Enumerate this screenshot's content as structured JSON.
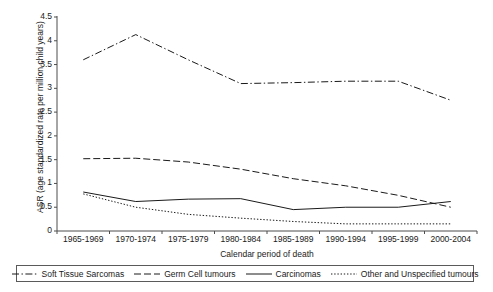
{
  "chart_data": {
    "type": "line",
    "title": "",
    "xlabel": "Calendar period of death",
    "ylabel": "ASR (age standardized rate per million child years)",
    "categories": [
      "1965-1969",
      "1970-1974",
      "1975-1979",
      "1980-1984",
      "1985-1989",
      "1990-1994",
      "1995-1999",
      "2000-2004"
    ],
    "ylim": [
      0,
      4.5
    ],
    "yticks": [
      "0",
      "0.5",
      "1",
      "1.5",
      "2",
      "2.5",
      "3",
      "3.5",
      "4",
      "4.5"
    ],
    "ytick_values": [
      0,
      0.5,
      1,
      1.5,
      2,
      2.5,
      3,
      3.5,
      4,
      4.5
    ],
    "grid": false,
    "legend_position": "bottom",
    "series": [
      {
        "name": "Soft Tissue Sarcomas",
        "style": "dash-dot",
        "color": "#1a1a1a",
        "values": [
          3.6,
          4.13,
          3.6,
          3.1,
          3.12,
          3.15,
          3.15,
          2.75
        ]
      },
      {
        "name": "Germ Cell tumours",
        "style": "dashed",
        "color": "#1a1a1a",
        "values": [
          1.52,
          1.53,
          1.45,
          1.3,
          1.1,
          0.95,
          0.75,
          0.5
        ]
      },
      {
        "name": "Carcinomas",
        "style": "solid",
        "color": "#1a1a1a",
        "values": [
          0.82,
          0.62,
          0.67,
          0.68,
          0.45,
          0.5,
          0.5,
          0.62
        ]
      },
      {
        "name": "Other and Unspecified tumours",
        "style": "dotted",
        "color": "#1a1a1a",
        "values": [
          0.78,
          0.5,
          0.35,
          0.27,
          0.2,
          0.15,
          0.15,
          0.15
        ]
      }
    ]
  },
  "axis": {
    "line_color": "#4d4d4d"
  }
}
